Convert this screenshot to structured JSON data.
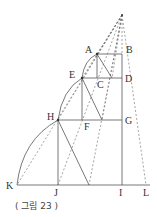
{
  "figure": {
    "caption": "( 그림 23 )",
    "labels": {
      "A": "A",
      "B": "B",
      "C": "C",
      "D": "D",
      "E": "E",
      "F": "F",
      "G": "G",
      "H": "H",
      "I": "I",
      "J": "J",
      "K": "K",
      "L": "L"
    },
    "points": {
      "apex": [
        122,
        15
      ],
      "A": [
        97,
        54
      ],
      "B": [
        122,
        54
      ],
      "E": [
        82,
        78
      ],
      "C": [
        97,
        78
      ],
      "D": [
        122,
        78
      ],
      "H": [
        58,
        120
      ],
      "F": [
        82,
        120
      ],
      "G": [
        122,
        120
      ],
      "K": [
        17,
        185
      ],
      "J": [
        58,
        185
      ],
      "I": [
        122,
        185
      ],
      "L": [
        146,
        185
      ]
    },
    "colors": {
      "line": "#555555",
      "text": "#333333"
    }
  }
}
